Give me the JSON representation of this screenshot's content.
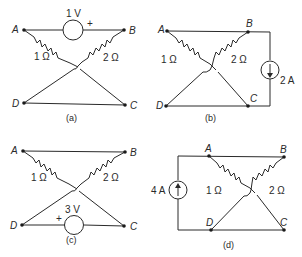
{
  "figure": {
    "panels": [
      {
        "id": "a",
        "caption": "(a)",
        "nodes": {
          "A": "A",
          "B": "B",
          "C": "C",
          "D": "D"
        },
        "resistors": [
          {
            "from": "A",
            "to": "C",
            "label": "1 Ω"
          },
          {
            "from": "B",
            "to": "D",
            "label": "2 Ω"
          }
        ],
        "wires": [
          [
            "D",
            "C"
          ]
        ],
        "source": {
          "type": "voltage",
          "between": [
            "A",
            "B"
          ],
          "value": "1 V",
          "plus_side": "B",
          "plus": "+"
        }
      },
      {
        "id": "b",
        "caption": "(b)",
        "nodes": {
          "A": "A",
          "B": "B",
          "C": "C",
          "D": "D"
        },
        "resistors": [
          {
            "from": "A",
            "to": "C",
            "label": "1 Ω"
          },
          {
            "from": "B",
            "to": "D",
            "label": "2 Ω"
          }
        ],
        "wires": [
          [
            "A",
            "B"
          ],
          [
            "D",
            "C"
          ]
        ],
        "source": {
          "type": "current",
          "between": [
            "B",
            "C"
          ],
          "value": "2 A",
          "direction": "down"
        }
      },
      {
        "id": "c",
        "caption": "(c)",
        "nodes": {
          "A": "A",
          "B": "B",
          "C": "C",
          "D": "D"
        },
        "resistors": [
          {
            "from": "A",
            "to": "C",
            "label": "1 Ω"
          },
          {
            "from": "B",
            "to": "D",
            "label": "2 Ω"
          }
        ],
        "wires": [
          [
            "A",
            "B"
          ]
        ],
        "source": {
          "type": "voltage",
          "between": [
            "D",
            "C"
          ],
          "value": "3 V",
          "plus_side": "D",
          "plus": "+"
        }
      },
      {
        "id": "d",
        "caption": "(d)",
        "nodes": {
          "A": "A",
          "B": "B",
          "C": "C",
          "D": "D"
        },
        "resistors": [
          {
            "from": "A",
            "to": "C",
            "label": "1 Ω"
          },
          {
            "from": "B",
            "to": "D",
            "label": "2 Ω"
          }
        ],
        "wires": [
          [
            "A",
            "B"
          ],
          [
            "D",
            "C"
          ]
        ],
        "source": {
          "type": "current",
          "between": [
            "D",
            "A"
          ],
          "value": "4 A",
          "direction": "up"
        }
      }
    ]
  }
}
